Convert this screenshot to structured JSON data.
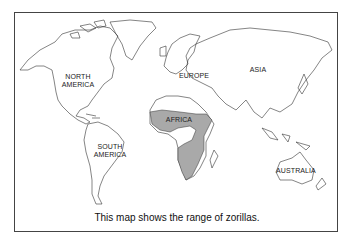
{
  "map": {
    "caption": "This map shows the range of zorillas.",
    "labels": {
      "north_america": [
        "NORTH",
        "AMERICA"
      ],
      "south_america": [
        "SOUTH",
        "AMERICA"
      ],
      "europe": "EUROPE",
      "asia": "ASIA",
      "africa": "AFRICA",
      "australia": "AUSTRALIA"
    },
    "range_color": "#a9a9a9",
    "outline_color": "#333333"
  }
}
